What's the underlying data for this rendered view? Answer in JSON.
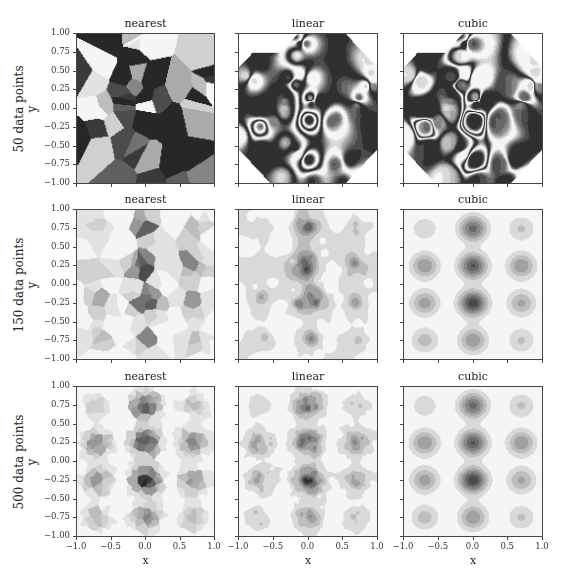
{
  "figure": {
    "row_labels": [
      "50 data points\ny",
      "150 data points\ny",
      "500 data points\ny"
    ],
    "row_label_lines": [
      [
        "50 data points",
        "y"
      ],
      [
        "150 data points",
        "y"
      ],
      [
        "500 data points",
        "y"
      ]
    ],
    "column_titles": [
      "nearest",
      "linear",
      "cubic"
    ],
    "xlabel": "x",
    "ylabel": "y",
    "yticks": [
      "1.00",
      "0.75",
      "0.50",
      "0.25",
      "0.00",
      "−0.25",
      "−0.50",
      "−0.75",
      "−1.00"
    ],
    "xticks": [
      "−1.0",
      "−0.5",
      "0.0",
      "0.5",
      "1.0"
    ],
    "colormap": "greys (reversed, filled contours)"
  },
  "chart_data": {
    "type": "heatmap",
    "title": "",
    "layout": "3x3 grid of filled-contour interpolation panels",
    "rows": [
      "50 data points",
      "150 data points",
      "500 data points"
    ],
    "columns": [
      "nearest",
      "linear",
      "cubic"
    ],
    "xlabel": "x",
    "ylabel": "y",
    "xlim": [
      -1.0,
      1.0
    ],
    "ylim": [
      -1.0,
      1.0
    ],
    "xticks": [
      -1.0,
      -0.5,
      0.0,
      0.5,
      1.0
    ],
    "yticks": [
      -1.0,
      -0.75,
      -0.5,
      -0.25,
      0.0,
      0.25,
      0.5,
      0.75,
      1.0
    ],
    "grid": false,
    "colormap": "gray_r stepped",
    "blob_centers_x": [
      -0.7,
      0.0,
      0.7
    ],
    "blob_centers_y": [
      0.75,
      0.25,
      -0.25,
      -0.75
    ],
    "blob_intensity": [
      [
        0.25,
        0.75,
        0.3
      ],
      [
        0.55,
        0.85,
        0.55
      ],
      [
        0.5,
        0.95,
        0.45
      ],
      [
        0.35,
        0.55,
        0.3
      ]
    ]
  }
}
